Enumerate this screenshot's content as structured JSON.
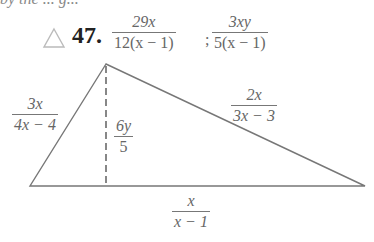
{
  "problem": {
    "number": "47.",
    "marker_icon": "triangle-outline-icon",
    "expression": {
      "fraction1": {
        "numerator": "29x",
        "denominator": "12(x − 1)"
      },
      "separator": ";",
      "fraction2": {
        "numerator": "3xy",
        "denominator": "5(x − 1)"
      }
    }
  },
  "top_partial_text": "by the ... g...",
  "figure": {
    "shape": "triangle",
    "left_side": {
      "numerator": "3x",
      "denominator": "4x − 4"
    },
    "height": {
      "numerator": "6y",
      "denominator": "5"
    },
    "right_side": {
      "numerator": "2x",
      "denominator": "3x − 3"
    },
    "base": {
      "numerator": "x",
      "denominator": "x − 1"
    }
  }
}
